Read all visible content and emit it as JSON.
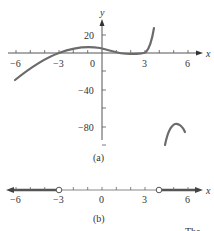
{
  "figure_a": {
    "caption": "(a)",
    "x_axis_label": "x",
    "y_axis_label": "y",
    "x_tick_labels": [
      "−6",
      "−3",
      "0",
      "3",
      "6"
    ],
    "y_tick_labels": [
      "20",
      "−40",
      "−80"
    ],
    "curve_color": "#6b6b6b"
  },
  "figure_b": {
    "caption": "(b)",
    "axis_label": "x",
    "tick_labels": [
      "−6",
      "−3",
      "0",
      "3",
      "6"
    ],
    "open_points": [
      "−3",
      "4"
    ],
    "shaded_rays": [
      "x < −3",
      "x > 4"
    ]
  },
  "footer_text": "The"
}
